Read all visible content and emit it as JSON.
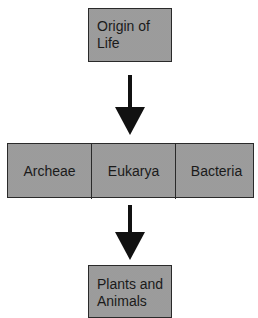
{
  "diagram": {
    "type": "flowchart",
    "nodes": [
      {
        "id": "origin",
        "label": "Origin of\nLife"
      },
      {
        "id": "archeae",
        "label": "Archeae"
      },
      {
        "id": "eukarya",
        "label": "Eukarya"
      },
      {
        "id": "bacteria",
        "label": "Bacteria"
      },
      {
        "id": "plants_animals",
        "label": "Plants and\nAnimals"
      }
    ],
    "edges": [
      {
        "from": "origin",
        "to": "domains_row"
      },
      {
        "from": "domains_row",
        "to": "plants_animals"
      }
    ],
    "top_box": {
      "label": "Origin of\nLife"
    },
    "domains": [
      {
        "label": "Archeae"
      },
      {
        "label": "Eukarya"
      },
      {
        "label": "Bacteria"
      }
    ],
    "bottom_box": {
      "label": "Plants and\nAnimals"
    }
  },
  "colors": {
    "box_fill": "#c4c4c4",
    "border": "#2a2a2a",
    "arrow": "#111111",
    "text": "#1a1a1a"
  }
}
